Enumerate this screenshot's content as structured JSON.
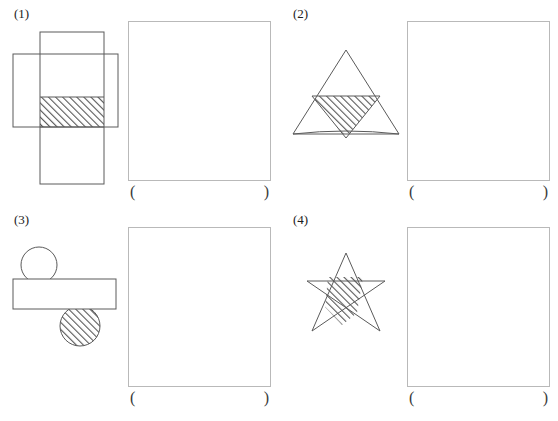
{
  "page": {
    "background_color": "#ffffff",
    "stroke_color": "#4a4a4a",
    "box_border_color": "#b9b9b9",
    "hatch_color": "#555555",
    "width": 558,
    "height": 421
  },
  "problems": [
    {
      "number": "(1)",
      "figure_name": "two-overlapping-rectangles",
      "description": "A tall vertical rectangle crossing a wide horizontal rectangle; the overlap region is hatched",
      "answer_paren_open": "(",
      "answer_paren_close": ")"
    },
    {
      "number": "(2)",
      "figure_name": "two-overlapping-triangles",
      "description": "A large wide upward triangle overlapping a narrow upward triangle; the lens-shaped overlap is hatched",
      "answer_paren_open": "(",
      "answer_paren_close": ")"
    },
    {
      "number": "(3)",
      "figure_name": "rectangle-with-two-circles",
      "description": "A circle above a horizontal rectangle and a hatched circle below it, both overlapping the rectangle",
      "answer_paren_open": "(",
      "answer_paren_close": ")"
    },
    {
      "number": "(4)",
      "figure_name": "five-pointed-star",
      "description": "A five-pointed pentagram star with part of its interior hatched",
      "answer_paren_open": "(",
      "answer_paren_close": ")"
    }
  ]
}
